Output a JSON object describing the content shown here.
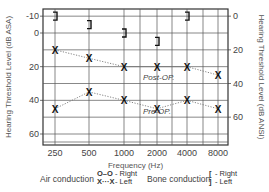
{
  "chart_data": {
    "type": "line",
    "title": "",
    "xlabel": "Frequency (Hz)",
    "ylabel": "Hearing Threshold Level (dB ASA)",
    "ylabel_right": "Hearing Threshold Level (dB ANSI)",
    "categories": [
      "250",
      "500",
      "1000",
      "2000",
      "4000",
      "8000"
    ],
    "y_ticks_left": [
      -10,
      0,
      20,
      40,
      60
    ],
    "y_ticks_right": [
      0,
      20,
      40,
      60
    ],
    "ylim": [
      62,
      -12
    ],
    "grid": true,
    "series": [
      {
        "name": "Post-OP. (Air conduction, Left)",
        "marker": "X",
        "line": "dotted",
        "values": [
          10,
          15,
          20,
          20,
          20,
          25
        ]
      },
      {
        "name": "Pre-OP. (Air conduction, Left)",
        "marker": "X",
        "line": "dotted",
        "values": [
          45,
          35,
          40,
          45,
          40,
          45
        ]
      },
      {
        "name": "Bone conduction, Left",
        "marker": "]",
        "line": "none",
        "values": [
          -10,
          -5,
          0,
          5,
          -10,
          null
        ]
      }
    ],
    "annotations": [
      "Post-OP.",
      "Pre-OP."
    ],
    "legend": {
      "air_conduction": {
        "label": "Air conduction",
        "right": "O–O - Right",
        "left": "X···X - Left"
      },
      "bone_conduction": {
        "label": "Bone conduction",
        "right": "[ - Right",
        "left": "] - Left"
      }
    }
  },
  "labels": {
    "xlabel": "Frequency (Hz)",
    "ylabel_left": "Hearing Threshold Level (dB ASA)",
    "ylabel_right": "Hearing Threshold Level (dB ANSI)",
    "post_op": "Post-OP.",
    "pre_op": "Pre-OP.",
    "air_label": "Air conduction",
    "air_right_sym": "O–O",
    "air_right": "- Right",
    "air_left_sym": "X···X",
    "air_left": "- Left",
    "bone_label": "Bone conduction",
    "bone_right_sym": "[",
    "bone_right": "- Right",
    "bone_left_sym": "]",
    "bone_left": "- Left"
  }
}
